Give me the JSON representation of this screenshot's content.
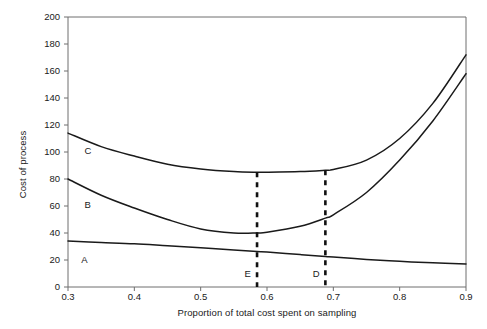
{
  "chart_data": {
    "type": "line",
    "title": "",
    "xlabel": "Proportion of total cost spent on sampling",
    "ylabel": "Cost of process",
    "xlim": [
      0.3,
      0.9
    ],
    "ylim": [
      0,
      200
    ],
    "xticks": [
      0.3,
      0.4,
      0.5,
      0.6,
      0.7,
      0.8,
      0.9
    ],
    "xtick_labels": [
      "0.3",
      "0.4",
      "0.5",
      "0.6",
      "0.7",
      "0.8",
      "0.9"
    ],
    "yticks": [
      0,
      20,
      40,
      60,
      80,
      100,
      120,
      140,
      160,
      180,
      200
    ],
    "ytick_labels": [
      "0",
      "20",
      "40",
      "60",
      "80",
      "100",
      "120",
      "140",
      "160",
      "180",
      "200"
    ],
    "grid": false,
    "legend": "inline-curve-labels",
    "series": [
      {
        "name": "A",
        "label": "A",
        "label_x": 0.32,
        "label_y": 20,
        "color": "#1a1a1a",
        "x": [
          0.3,
          0.35,
          0.4,
          0.45,
          0.5,
          0.55,
          0.585,
          0.6,
          0.65,
          0.688,
          0.7,
          0.75,
          0.8,
          0.85,
          0.9
        ],
        "y": [
          34.0,
          33.0,
          32.0,
          30.5,
          29.0,
          27.5,
          26.3,
          26.0,
          24.0,
          22.6,
          22.2,
          20.4,
          19.0,
          17.9,
          17.0
        ]
      },
      {
        "name": "B",
        "label": "B",
        "label_x": 0.325,
        "label_y": 61,
        "color": "#1a1a1a",
        "x": [
          0.3,
          0.35,
          0.4,
          0.45,
          0.5,
          0.55,
          0.585,
          0.6,
          0.65,
          0.688,
          0.7,
          0.75,
          0.8,
          0.85,
          0.9
        ],
        "y": [
          80.0,
          68.0,
          58.5,
          50.0,
          43.0,
          40.0,
          40.0,
          40.5,
          45.0,
          51.0,
          53.5,
          70.0,
          94.0,
          123.0,
          158.0
        ]
      },
      {
        "name": "C",
        "label": "C",
        "label_x": 0.325,
        "label_y": 101,
        "color": "#1a1a1a",
        "x": [
          0.3,
          0.35,
          0.4,
          0.45,
          0.5,
          0.55,
          0.585,
          0.6,
          0.65,
          0.688,
          0.7,
          0.75,
          0.8,
          0.85,
          0.9
        ],
        "y": [
          114.0,
          104.0,
          97.0,
          91.0,
          87.5,
          85.5,
          85.0,
          85.0,
          85.5,
          86.5,
          87.0,
          94.0,
          110.0,
          136.0,
          172.0
        ]
      }
    ],
    "annotations": [
      {
        "name": "E",
        "label": "E",
        "type": "vertical-dashed-line",
        "x": 0.585,
        "y_top": 85,
        "y_bottom": 0,
        "label_x": 0.566,
        "label_y": 10
      },
      {
        "name": "D",
        "label": "D",
        "type": "vertical-dashed-line",
        "x": 0.688,
        "y_top": 86.5,
        "y_bottom": 0,
        "label_x": 0.669,
        "label_y": 10
      }
    ]
  },
  "colors": {
    "curve": "#1a1a1a",
    "axis": "#6e6e6e",
    "dashed": "#111111",
    "background": "#ffffff",
    "text": "#1a1a1a"
  }
}
